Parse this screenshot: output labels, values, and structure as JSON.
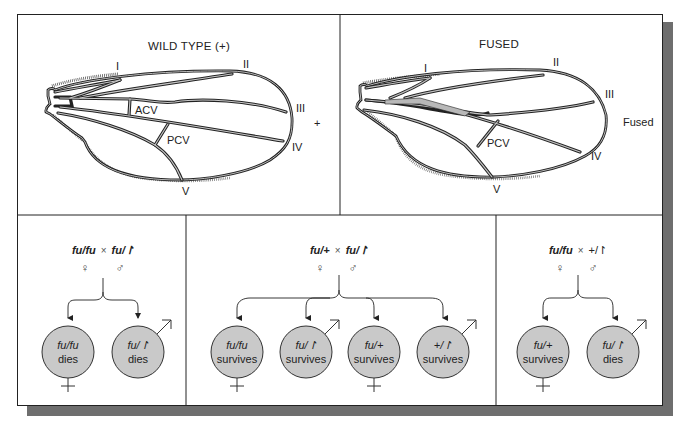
{
  "top": {
    "wild_type": {
      "title": "WILD TYPE (+)",
      "vein_labels": [
        "I",
        "II",
        "III",
        "IV",
        "V"
      ],
      "crossvein_labels": [
        "ACV",
        "PCV"
      ],
      "side_label": "+"
    },
    "fused": {
      "title": "FUSED",
      "vein_labels": [
        "I",
        "II",
        "III",
        "IV",
        "V"
      ],
      "crossvein_labels": [
        "PCV"
      ],
      "side_label": "Fused"
    }
  },
  "crosses": [
    {
      "parent_female": "fu/fu",
      "parent_male": "fu/↾",
      "times": "×",
      "female_symbol": "♀",
      "male_symbol": "♂",
      "offspring": [
        {
          "genotype": "fu/fu",
          "outcome": "dies",
          "sex": "female"
        },
        {
          "genotype": "fu/↾",
          "outcome": "dies",
          "sex": "male"
        }
      ]
    },
    {
      "parent_female": "fu/+",
      "parent_male": "fu/↾",
      "times": "×",
      "female_symbol": "♀",
      "male_symbol": "♂",
      "offspring": [
        {
          "genotype": "fu/fu",
          "outcome": "survives",
          "sex": "female"
        },
        {
          "genotype": "fu/↾",
          "outcome": "survives",
          "sex": "male"
        },
        {
          "genotype": "fu/+",
          "outcome": "survives",
          "sex": "female"
        },
        {
          "genotype": "+/↾",
          "outcome": "survives",
          "sex": "male"
        }
      ]
    },
    {
      "parent_female": "fu/fu",
      "parent_male": "+/↾",
      "times": "×",
      "female_symbol": "♀",
      "male_symbol": "♂",
      "offspring": [
        {
          "genotype": "fu/+",
          "outcome": "survives",
          "sex": "female"
        },
        {
          "genotype": "fu/↾",
          "outcome": "dies",
          "sex": "male"
        }
      ]
    }
  ],
  "colors": {
    "circle_fill": "#c9c9c9",
    "circle_stroke": "#333333",
    "vein_fill": "#b8b8b8",
    "shadow": "#6e6e6e",
    "line": "#222222"
  }
}
